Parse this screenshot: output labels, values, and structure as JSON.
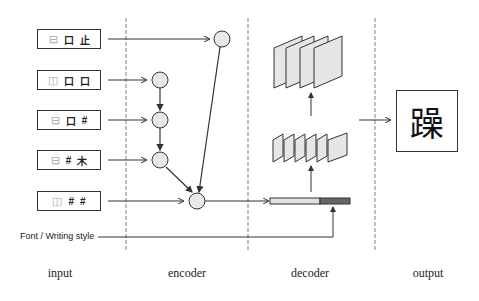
{
  "diagram": {
    "type": "pipeline",
    "columns": [
      {
        "id": "input",
        "label": "input"
      },
      {
        "id": "encoder",
        "label": "encoder"
      },
      {
        "id": "decoder",
        "label": "decoder"
      },
      {
        "id": "output",
        "label": "output"
      }
    ],
    "inputs": [
      {
        "structure": "⊟",
        "components": [
          "口",
          "止"
        ]
      },
      {
        "structure": "◫",
        "components": [
          "口",
          "口"
        ]
      },
      {
        "structure": "⊟",
        "components": [
          "口",
          "#"
        ]
      },
      {
        "structure": "⊟",
        "components": [
          "#",
          "木"
        ]
      },
      {
        "structure": "◫",
        "components": [
          "#",
          "#"
        ]
      }
    ],
    "style_input": {
      "label": "Font / Writing style"
    },
    "output": {
      "character": "躁"
    },
    "colors": {
      "line": "#333333",
      "divider": "#aaaaaa",
      "node_fill": "#e8e8e8",
      "feature_fill": "#e6e6e6",
      "vector_light": "#e0e0e0",
      "vector_dark": "#666666"
    }
  }
}
